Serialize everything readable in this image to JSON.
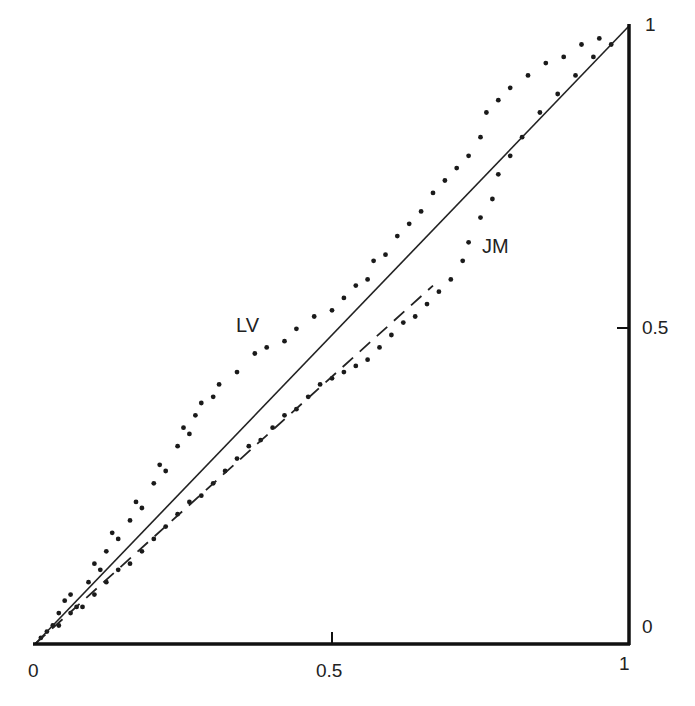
{
  "chart_data": {
    "type": "scatter",
    "title": "",
    "xlabel": "",
    "ylabel": "",
    "xlim": [
      0,
      1
    ],
    "ylim": [
      0,
      1
    ],
    "grid": false,
    "x_ticks": [
      "0",
      "0.5",
      "1"
    ],
    "y_ticks": [
      "0",
      "0.5",
      "1"
    ],
    "annotations": [
      {
        "text": "LV",
        "x": 0.34,
        "y": 0.52
      },
      {
        "text": "JM",
        "x": 0.74,
        "y": 0.63
      }
    ],
    "lines": [
      {
        "name": "diagonal",
        "style": "solid",
        "points": [
          [
            0,
            0
          ],
          [
            1,
            1
          ]
        ]
      },
      {
        "name": "JM fit",
        "style": "dashed",
        "points": [
          [
            0,
            0
          ],
          [
            0.67,
            0.58
          ]
        ]
      }
    ],
    "series": [
      {
        "name": "LV",
        "marker": "dot",
        "points": [
          [
            0.01,
            0.01
          ],
          [
            0.03,
            0.03
          ],
          [
            0.04,
            0.05
          ],
          [
            0.05,
            0.07
          ],
          [
            0.07,
            0.06
          ],
          [
            0.06,
            0.08
          ],
          [
            0.09,
            0.1
          ],
          [
            0.1,
            0.13
          ],
          [
            0.11,
            0.12
          ],
          [
            0.12,
            0.15
          ],
          [
            0.13,
            0.18
          ],
          [
            0.14,
            0.17
          ],
          [
            0.16,
            0.2
          ],
          [
            0.17,
            0.23
          ],
          [
            0.18,
            0.22
          ],
          [
            0.2,
            0.26
          ],
          [
            0.21,
            0.29
          ],
          [
            0.22,
            0.28
          ],
          [
            0.24,
            0.32
          ],
          [
            0.25,
            0.35
          ],
          [
            0.26,
            0.34
          ],
          [
            0.27,
            0.37
          ],
          [
            0.28,
            0.39
          ],
          [
            0.3,
            0.4
          ],
          [
            0.31,
            0.42
          ],
          [
            0.34,
            0.44
          ],
          [
            0.37,
            0.47
          ],
          [
            0.39,
            0.48
          ],
          [
            0.42,
            0.49
          ],
          [
            0.44,
            0.51
          ],
          [
            0.47,
            0.53
          ],
          [
            0.5,
            0.54
          ],
          [
            0.52,
            0.56
          ],
          [
            0.54,
            0.58
          ],
          [
            0.56,
            0.59
          ],
          [
            0.57,
            0.62
          ],
          [
            0.59,
            0.63
          ],
          [
            0.61,
            0.66
          ],
          [
            0.63,
            0.68
          ],
          [
            0.65,
            0.7
          ],
          [
            0.67,
            0.73
          ],
          [
            0.69,
            0.75
          ],
          [
            0.71,
            0.77
          ],
          [
            0.73,
            0.79
          ],
          [
            0.75,
            0.82
          ],
          [
            0.76,
            0.86
          ],
          [
            0.78,
            0.88
          ],
          [
            0.8,
            0.9
          ],
          [
            0.83,
            0.92
          ],
          [
            0.86,
            0.94
          ],
          [
            0.89,
            0.95
          ],
          [
            0.92,
            0.97
          ],
          [
            0.95,
            0.98
          ]
        ]
      },
      {
        "name": "JM",
        "marker": "dot",
        "points": [
          [
            0.02,
            0.02
          ],
          [
            0.04,
            0.03
          ],
          [
            0.06,
            0.05
          ],
          [
            0.08,
            0.06
          ],
          [
            0.1,
            0.08
          ],
          [
            0.12,
            0.1
          ],
          [
            0.14,
            0.12
          ],
          [
            0.16,
            0.13
          ],
          [
            0.18,
            0.15
          ],
          [
            0.2,
            0.17
          ],
          [
            0.22,
            0.19
          ],
          [
            0.24,
            0.21
          ],
          [
            0.26,
            0.23
          ],
          [
            0.28,
            0.24
          ],
          [
            0.3,
            0.26
          ],
          [
            0.32,
            0.28
          ],
          [
            0.34,
            0.3
          ],
          [
            0.36,
            0.32
          ],
          [
            0.38,
            0.33
          ],
          [
            0.4,
            0.35
          ],
          [
            0.42,
            0.37
          ],
          [
            0.44,
            0.38
          ],
          [
            0.46,
            0.4
          ],
          [
            0.48,
            0.42
          ],
          [
            0.5,
            0.43
          ],
          [
            0.52,
            0.44
          ],
          [
            0.54,
            0.45
          ],
          [
            0.56,
            0.46
          ],
          [
            0.58,
            0.48
          ],
          [
            0.6,
            0.5
          ],
          [
            0.62,
            0.52
          ],
          [
            0.64,
            0.53
          ],
          [
            0.66,
            0.55
          ],
          [
            0.68,
            0.57
          ],
          [
            0.7,
            0.59
          ],
          [
            0.72,
            0.62
          ],
          [
            0.73,
            0.65
          ],
          [
            0.75,
            0.69
          ],
          [
            0.77,
            0.72
          ],
          [
            0.78,
            0.76
          ],
          [
            0.8,
            0.79
          ],
          [
            0.82,
            0.82
          ],
          [
            0.85,
            0.86
          ],
          [
            0.88,
            0.89
          ],
          [
            0.91,
            0.92
          ],
          [
            0.94,
            0.95
          ],
          [
            0.97,
            0.97
          ]
        ]
      }
    ]
  },
  "labels": {
    "x_tick_0": "0",
    "x_tick_05": "0.5",
    "x_tick_1": "1",
    "y_tick_0": "0",
    "y_tick_05": "0.5",
    "y_tick_1": "1",
    "series_lv": "LV",
    "series_jm": "JM"
  }
}
